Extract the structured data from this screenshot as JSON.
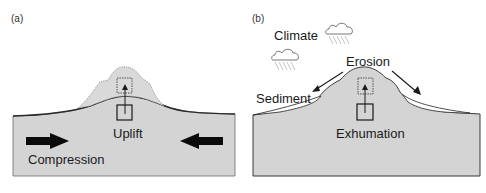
{
  "panels": [
    {
      "id": "a",
      "label": "(a)",
      "labels": {
        "uplift": "Uplift",
        "compression": "Compression"
      }
    },
    {
      "id": "b",
      "label": "(b)",
      "labels": {
        "climate": "Climate",
        "erosion": "Erosion",
        "sediment": "Sediment",
        "exhumation": "Exhumation"
      }
    }
  ],
  "colors": {
    "crust_fill": "#d4d4d4",
    "outline": "#2a2a2a",
    "sediment_fill": "#ffffff",
    "rain": "#9a9a9a"
  },
  "icons": [
    "cloud-rain-icon",
    "arrow-right-icon",
    "arrow-left-icon",
    "arrow-up-icon"
  ]
}
